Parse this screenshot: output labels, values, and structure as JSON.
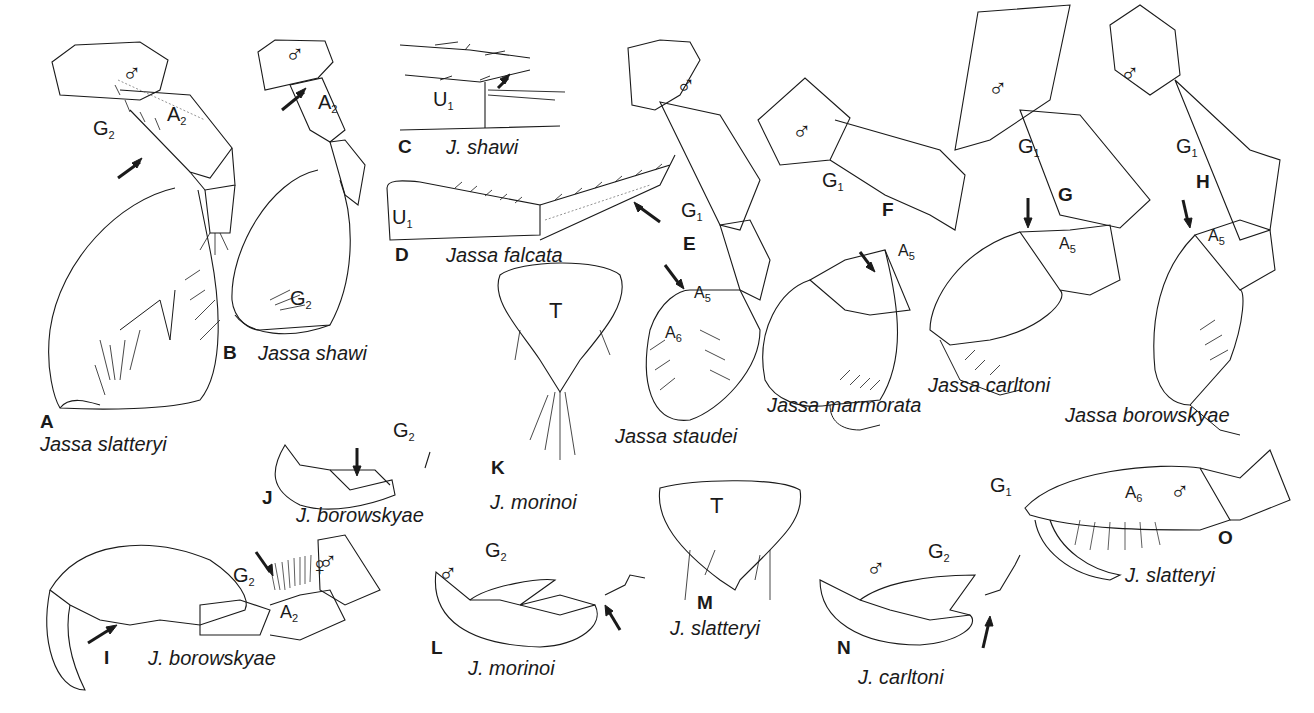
{
  "figure": {
    "panels": [
      {
        "letter": "A",
        "species": "Jassa slatteryi",
        "parts": [
          "G2",
          "A2"
        ],
        "sex": "♂"
      },
      {
        "letter": "B",
        "species": "Jassa shawi",
        "parts": [
          "A2",
          "G2"
        ],
        "sex": "♂"
      },
      {
        "letter": "C",
        "species": "J. shawi",
        "parts": [
          "U1"
        ]
      },
      {
        "letter": "D",
        "species": "Jassa falcata",
        "parts": [
          "U1"
        ]
      },
      {
        "letter": "E",
        "species": "Jassa staudei",
        "parts": [
          "G1",
          "A5",
          "A6"
        ],
        "sex": "♂"
      },
      {
        "letter": "F",
        "species": "Jassa marmorata",
        "parts": [
          "G1",
          "A5"
        ],
        "sex": "♂"
      },
      {
        "letter": "G",
        "species": "Jassa carltoni",
        "parts": [
          "G1",
          "A5"
        ],
        "sex": "♂"
      },
      {
        "letter": "H",
        "species": "Jassa borowskyae",
        "parts": [
          "G1",
          "A5"
        ],
        "sex": "♂"
      },
      {
        "letter": "I",
        "species": "J. borowskyae",
        "parts": [
          "G2",
          "A2"
        ],
        "sex": "♂"
      },
      {
        "letter": "J",
        "species": "J. borowskyae",
        "parts": [
          "G2"
        ],
        "sex": "♀"
      },
      {
        "letter": "K",
        "species": "J. morinoi",
        "parts": [
          "T"
        ]
      },
      {
        "letter": "L",
        "species": "J. morinoi",
        "parts": [
          "G2"
        ],
        "sex": "♂"
      },
      {
        "letter": "M",
        "species": "J. slatteryi",
        "parts": [
          "T"
        ]
      },
      {
        "letter": "N",
        "species": "J. carltoni",
        "parts": [
          "G2"
        ],
        "sex": "♂"
      },
      {
        "letter": "O",
        "species": "J. slatteryi",
        "parts": [
          "G1",
          "A6"
        ],
        "sex": "♂"
      }
    ],
    "symbols": {
      "male": "♂",
      "female": "♀"
    },
    "part_labels": {
      "G": "G",
      "A": "A",
      "U": "U",
      "T": "T",
      "sub1": "1",
      "sub2": "2",
      "sub5": "5",
      "sub6": "6"
    },
    "colors": {
      "ink": "#1a1a1a",
      "background": "#ffffff",
      "dotted": "#777777"
    }
  }
}
